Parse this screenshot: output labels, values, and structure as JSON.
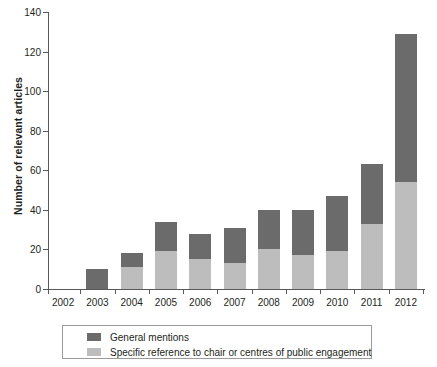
{
  "chart_data": {
    "type": "bar",
    "stacked": true,
    "title": "",
    "xlabel": "",
    "ylabel": "Number of relevant articles",
    "categories": [
      "2002",
      "2003",
      "2004",
      "2005",
      "2006",
      "2007",
      "2008",
      "2009",
      "2010",
      "2011",
      "2012"
    ],
    "series": [
      {
        "name": "Specific reference to chair or centres of public engagement",
        "color": "#bdbdbd",
        "values": [
          0,
          0,
          11,
          19,
          15,
          13,
          20,
          17,
          19,
          33,
          54
        ]
      },
      {
        "name": "General mentions",
        "color": "#6b6b6b",
        "values": [
          0,
          10,
          7,
          15,
          13,
          18,
          20,
          23,
          28,
          30,
          75
        ]
      }
    ],
    "totals": [
      0,
      10,
      18,
      34,
      28,
      31,
      40,
      40,
      47,
      63,
      129
    ],
    "ylim": [
      0,
      140
    ],
    "yticks": [
      0,
      20,
      40,
      60,
      80,
      100,
      120,
      140
    ],
    "ytick_labels": [
      "0",
      "20",
      "40",
      "60",
      "80",
      "100",
      "120",
      "140"
    ],
    "grid": false,
    "legend_position": "below-axis"
  },
  "legend": {
    "entries": [
      {
        "label": "General mentions",
        "color": "#6b6b6b"
      },
      {
        "label": "Specific reference to chair or centres of public engagement",
        "color": "#bdbdbd"
      }
    ]
  },
  "colors": {
    "general_mentions": "#6b6b6b",
    "specific_reference": "#bdbdbd",
    "axis": "#58595b",
    "text": "#231f20",
    "background": "#ffffff"
  }
}
